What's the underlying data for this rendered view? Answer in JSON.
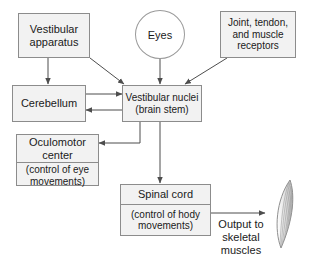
{
  "diagram": {
    "colors": {
      "box_fill": "#f2f2f2",
      "box_border": "#8c8c8c",
      "edge": "#4d4d4d",
      "text": "#1a1a1a",
      "background": "#ffffff"
    },
    "nodes": {
      "vestibular_apparatus": {
        "label": "Vestibular\napparatus",
        "line1": "Vestibular",
        "line2": "apparatus"
      },
      "eyes": {
        "label": "Eyes"
      },
      "receptors": {
        "line1": "Joint, tendon,",
        "line2": "and muscle",
        "line3": "receptors"
      },
      "cerebellum": {
        "label": "Cerebellum"
      },
      "vestibular_nuclei": {
        "line1": "Vestibular nuclei",
        "line2": "(brain stem)"
      },
      "oculomotor": {
        "title_line1": "Oculomotor",
        "title_line2": "center",
        "sub_line1": "(control of eye",
        "sub_line2": "movements)"
      },
      "spinal_cord": {
        "title": "Spinal cord",
        "sub_line1": "(control of hody",
        "sub_line2": "movements)"
      },
      "output_label": {
        "line1": "Output to",
        "line2": "skeletal",
        "line3": "muscles"
      },
      "muscle": {
        "name": "skeletal-muscle"
      }
    }
  }
}
